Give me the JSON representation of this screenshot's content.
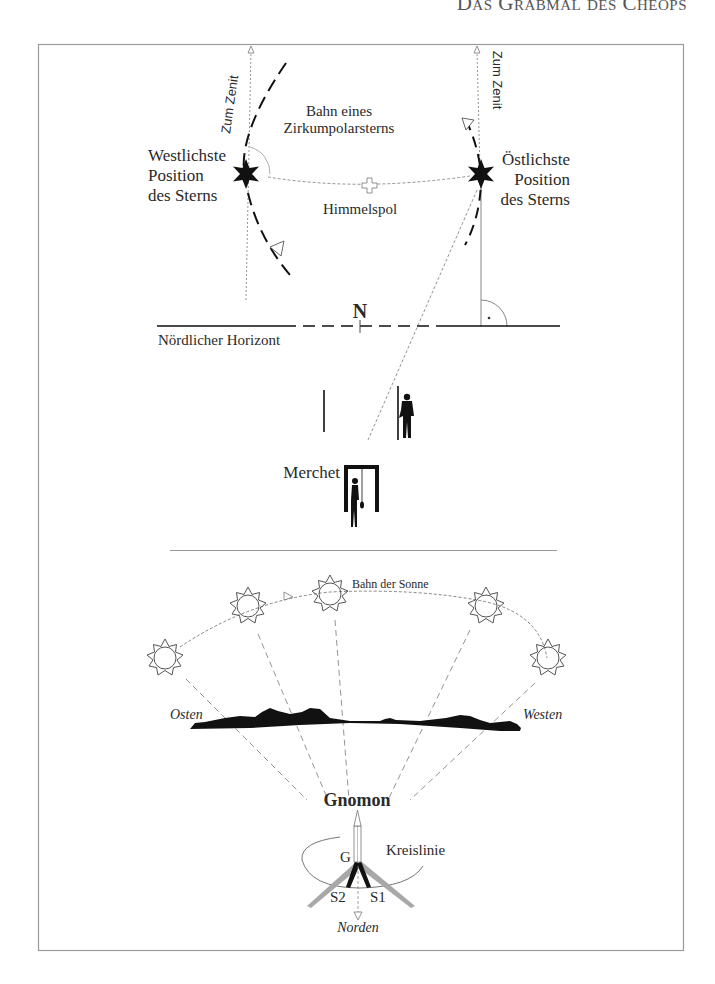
{
  "running_head": "Das Grabmal des Cheops",
  "figure_top": {
    "zenith_left": "Zum Zenit",
    "zenith_right": "Zum Zenit",
    "orbit_label_line1": "Bahn eines",
    "orbit_label_line2": "Zirkumpolarsterns",
    "west_star_line1": "Westlichste",
    "west_star_line2": "Position",
    "west_star_line3": "des Sterns",
    "east_star_line1": "Östlichste",
    "east_star_line2": "Position",
    "east_star_line3": "des Sterns",
    "celestial_pole": "Himmelspol",
    "north_marker": "N",
    "horizon_label": "Nördlicher Horizont",
    "merchet_label": "Merchet"
  },
  "figure_bottom": {
    "sun_path_label": "Bahn der Sonne",
    "east_label": "Osten",
    "west_label": "Westen",
    "gnomon_label": "Gnomon",
    "gnomon_point": "G",
    "circle_label": "Kreislinie",
    "shadow_2": "S2",
    "shadow_1": "S1",
    "north_label": "Norden",
    "sun_count": 5
  },
  "colors": {
    "frame": "#9a9a9a",
    "ink": "#111111",
    "grey_shadow": "#a8a8a8",
    "thin_line": "#8a8a8a"
  }
}
